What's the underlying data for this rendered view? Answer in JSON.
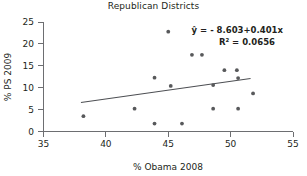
{
  "chart_data": {
    "type": "scatter",
    "title": "Republican Districts",
    "xlabel": "% Obama 2008",
    "ylabel": "% PS 2009",
    "xlim": [
      35,
      55
    ],
    "ylim": [
      0,
      25
    ],
    "xticks": [
      35,
      40,
      45,
      50,
      55
    ],
    "yticks": [
      0,
      5,
      10,
      15,
      20,
      25
    ],
    "grid": false,
    "legend": "none",
    "point_color": "#58595b",
    "line_color": "#4d4f53",
    "points": [
      {
        "x": 38.2,
        "y": 3.5
      },
      {
        "x": 42.3,
        "y": 5.2
      },
      {
        "x": 43.9,
        "y": 12.3
      },
      {
        "x": 43.9,
        "y": 1.8
      },
      {
        "x": 45.0,
        "y": 22.8
      },
      {
        "x": 45.2,
        "y": 10.4
      },
      {
        "x": 46.1,
        "y": 1.8
      },
      {
        "x": 46.9,
        "y": 17.5
      },
      {
        "x": 47.7,
        "y": 17.5
      },
      {
        "x": 48.6,
        "y": 10.6
      },
      {
        "x": 48.6,
        "y": 5.2
      },
      {
        "x": 49.5,
        "y": 14.0
      },
      {
        "x": 50.5,
        "y": 14.0
      },
      {
        "x": 50.6,
        "y": 12.2
      },
      {
        "x": 50.6,
        "y": 5.2
      },
      {
        "x": 51.8,
        "y": 8.7
      }
    ],
    "fit_line": {
      "intercept": -8.603,
      "slope": 0.401,
      "x_start": 38.0,
      "x_end": 51.6,
      "r_squared": 0.0656
    },
    "annotations": {
      "equation": "ŷ = - 8.603+0.401x",
      "r_squared_label": "R² = 0.0656"
    }
  }
}
